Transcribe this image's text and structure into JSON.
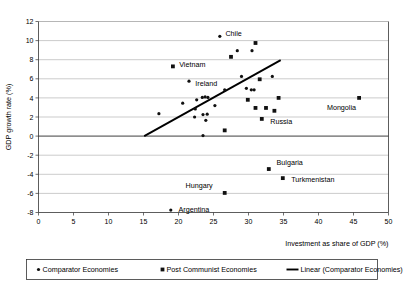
{
  "chart_data": {
    "type": "scatter",
    "title": "",
    "xlabel": "Investment as share of GDP (%)",
    "ylabel": "GDP growth rate (%)",
    "xlim": [
      0,
      50
    ],
    "ylim": [
      -8,
      12
    ],
    "xticks": [
      0,
      5,
      10,
      15,
      20,
      25,
      30,
      35,
      40,
      45,
      50
    ],
    "yticks": [
      -8,
      -6,
      -4,
      -2,
      0,
      2,
      4,
      6,
      8,
      10,
      12
    ],
    "xtick_labels": [
      "0",
      "5",
      "10",
      "15",
      "20",
      "25",
      "30",
      "35",
      "40",
      "45",
      "50"
    ],
    "ytick_labels": [
      "-8",
      "-6",
      "-4",
      "-2",
      "0",
      "2",
      "4",
      "6",
      "8",
      "10",
      "12"
    ],
    "grid": "horizontal",
    "legend_position": "bottom",
    "series": [
      {
        "name": "Comparator Economies",
        "marker": "circle",
        "color": "#111111",
        "points": [
          {
            "x": 17.2,
            "y": 2.35,
            "label": ""
          },
          {
            "x": 20.6,
            "y": 3.45,
            "label": ""
          },
          {
            "x": 21.5,
            "y": 5.75,
            "label": "Ireland"
          },
          {
            "x": 22.6,
            "y": 3.8,
            "label": ""
          },
          {
            "x": 22.4,
            "y": 2.85,
            "label": ""
          },
          {
            "x": 22.3,
            "y": 2.0,
            "label": ""
          },
          {
            "x": 23.4,
            "y": 4.05,
            "label": ""
          },
          {
            "x": 23.8,
            "y": 4.1,
            "label": ""
          },
          {
            "x": 24.2,
            "y": 4.05,
            "label": ""
          },
          {
            "x": 23.5,
            "y": 2.25,
            "label": ""
          },
          {
            "x": 24.1,
            "y": 2.3,
            "label": ""
          },
          {
            "x": 23.9,
            "y": 1.65,
            "label": ""
          },
          {
            "x": 23.5,
            "y": 0.05,
            "label": ""
          },
          {
            "x": 25.2,
            "y": 3.2,
            "label": ""
          },
          {
            "x": 25.9,
            "y": 10.45,
            "label": "Chile"
          },
          {
            "x": 26.6,
            "y": 4.85,
            "label": ""
          },
          {
            "x": 28.4,
            "y": 8.95,
            "label": ""
          },
          {
            "x": 29.0,
            "y": 6.25,
            "label": ""
          },
          {
            "x": 30.5,
            "y": 8.95,
            "label": ""
          },
          {
            "x": 29.7,
            "y": 5.0,
            "label": ""
          },
          {
            "x": 30.4,
            "y": 4.85,
            "label": ""
          },
          {
            "x": 30.8,
            "y": 4.85,
            "label": ""
          },
          {
            "x": 33.4,
            "y": 6.25,
            "label": ""
          },
          {
            "x": 18.9,
            "y": -7.75,
            "label": "Argentina"
          }
        ]
      },
      {
        "name": "Post Communist Economies",
        "marker": "square",
        "color": "#111111",
        "points": [
          {
            "x": 19.2,
            "y": 7.3,
            "label": "Vietnam"
          },
          {
            "x": 27.5,
            "y": 8.3,
            "label": ""
          },
          {
            "x": 31.0,
            "y": 9.75,
            "label": ""
          },
          {
            "x": 29.9,
            "y": 3.8,
            "label": ""
          },
          {
            "x": 31.6,
            "y": 5.95,
            "label": ""
          },
          {
            "x": 26.6,
            "y": 0.6,
            "label": ""
          },
          {
            "x": 31.0,
            "y": 2.95,
            "label": ""
          },
          {
            "x": 32.5,
            "y": 2.95,
            "label": ""
          },
          {
            "x": 31.9,
            "y": 1.8,
            "label": "Russia"
          },
          {
            "x": 33.7,
            "y": 2.65,
            "label": ""
          },
          {
            "x": 34.3,
            "y": 4.0,
            "label": ""
          },
          {
            "x": 45.8,
            "y": 4.0,
            "label": "Mongolia"
          },
          {
            "x": 32.9,
            "y": -3.45,
            "label": "Bulgaria"
          },
          {
            "x": 34.9,
            "y": -4.4,
            "label": "Turkmenistan"
          },
          {
            "x": 26.6,
            "y": -5.95,
            "label": "Hungary"
          }
        ]
      }
    ],
    "trendline": {
      "name": "Linear (Comparator Economies)",
      "x0": 15.1,
      "y0": 0.0,
      "x1": 34.6,
      "y1": 7.95,
      "color": "#000000"
    },
    "annotations": [
      {
        "text": "Chile",
        "x": 26.7,
        "y": 10.7,
        "anchor": "start"
      },
      {
        "text": "Vietnam",
        "x": 20.1,
        "y": 7.45,
        "anchor": "start"
      },
      {
        "text": "Ireland",
        "x": 22.4,
        "y": 5.5,
        "anchor": "start"
      },
      {
        "text": "Mongolia",
        "x": 41.2,
        "y": 3.0,
        "anchor": "start"
      },
      {
        "text": "Russia",
        "x": 33.1,
        "y": 1.55,
        "anchor": "start"
      },
      {
        "text": "Bulgaria",
        "x": 34.0,
        "y": -2.75,
        "anchor": "start"
      },
      {
        "text": "Turkmenistan",
        "x": 36.1,
        "y": -4.5,
        "anchor": "start"
      },
      {
        "text": "Hungary",
        "x": 21.0,
        "y": -5.15,
        "anchor": "start"
      },
      {
        "text": "Argentina",
        "x": 20.0,
        "y": -7.7,
        "anchor": "start"
      }
    ]
  },
  "legend": {
    "items": [
      {
        "label": "Comparator Economies",
        "marker": "circle"
      },
      {
        "label": "Post Communist Economies",
        "marker": "square"
      },
      {
        "label": "Linear (Comparator Economies)",
        "marker": "line"
      }
    ]
  }
}
